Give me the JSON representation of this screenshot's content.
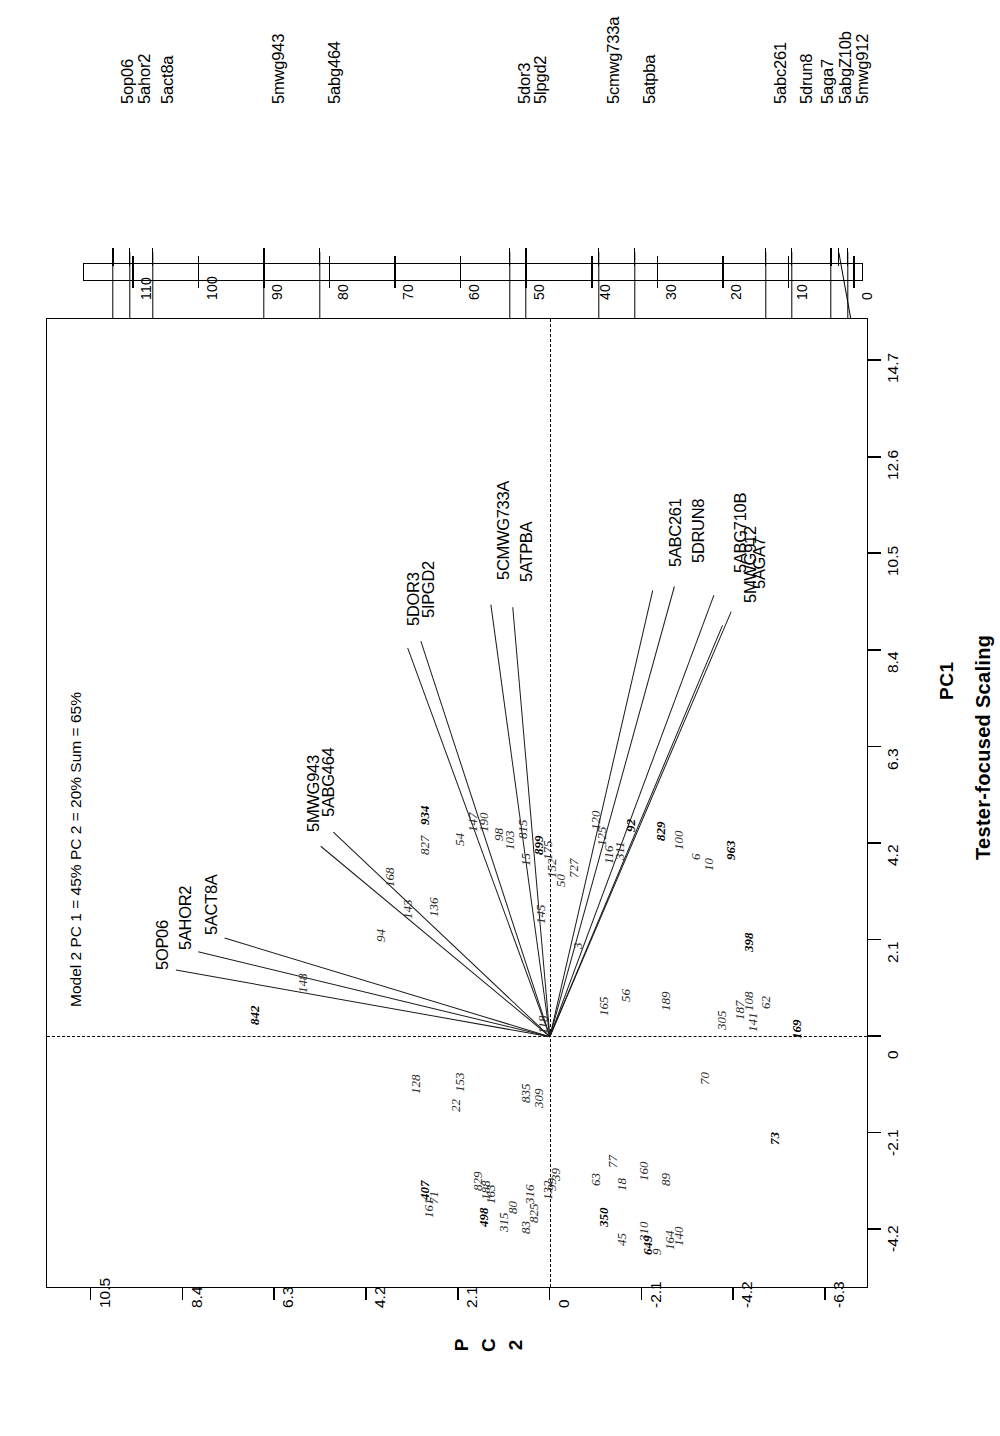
{
  "figure": {
    "title": "Tester-focused Scaling",
    "model_caption": "Model 2 PC 1 = 45% PC 2 = 20% Sum = 65%"
  },
  "axes": {
    "pc1": {
      "title": "PC1",
      "ticks": [
        "-4.2",
        "-2.1",
        "0",
        "2.1",
        "4.2",
        "6.3",
        "8.4",
        "10.5",
        "12.6",
        "14.7"
      ]
    },
    "pc2": {
      "title_chars": [
        "P",
        "C",
        "2"
      ],
      "ticks": [
        "10.5",
        "8.4",
        "6.3",
        "4.2",
        "2.1",
        "0",
        "-2.1",
        "-4.2",
        "-6.3"
      ]
    }
  },
  "linkage_map": {
    "scale_ticks": [
      "110",
      "100",
      "90",
      "80",
      "70",
      "60",
      "50",
      "40",
      "30",
      "20",
      "10",
      "0"
    ],
    "markers": [
      {
        "label": "5op06",
        "cm": 113.0
      },
      {
        "label": "5ahor2",
        "cm": 110.5
      },
      {
        "label": "5act8a",
        "cm": 107.0
      },
      {
        "label": "5mwg943",
        "cm": 90.0
      },
      {
        "label": "5abg464",
        "cm": 81.5
      },
      {
        "label": "5dor3",
        "cm": 52.5
      },
      {
        "label": "5lpgd2",
        "cm": 50.0
      },
      {
        "label": "5cmwg733a",
        "cm": 39.0
      },
      {
        "label": "5atpba",
        "cm": 33.5
      },
      {
        "label": "5abc261",
        "cm": 13.5
      },
      {
        "label": "5drun8",
        "cm": 9.5
      },
      {
        "label": "5abgZ10b",
        "cm": 3.5
      },
      {
        "label": "5aga7",
        "cm": 2.3
      },
      {
        "label": "5mwg912",
        "cm": 1.0
      }
    ]
  },
  "chart_data": {
    "type": "scatter",
    "title": "Tester-focused Scaling",
    "subtitle": "Model 2 PC 1 = 45% PC 2 = 20% Sum = 65%",
    "xlabel": "PC1",
    "ylabel": "PC 2",
    "xlim": [
      -5.5,
      15.6
    ],
    "ylim": [
      -7.3,
      11.5
    ],
    "grid": false,
    "legend": "none",
    "note": "GGE biplot rotated 90 degrees; marker vectors radiate from origin (0,0); italic numbers are genotype entry codes.",
    "vectors": [
      {
        "name": "5OP06",
        "pc1": 1.45,
        "pc2": 8.55
      },
      {
        "name": "5AHOR2",
        "pc1": 1.85,
        "pc2": 8.05
      },
      {
        "name": "5ACT8A",
        "pc1": 2.15,
        "pc2": 7.45
      },
      {
        "name": "5MWG943",
        "pc1": 4.15,
        "pc2": 5.25
      },
      {
        "name": "5ABG464",
        "pc1": 4.45,
        "pc2": 4.95
      },
      {
        "name": "5DOR3",
        "pc1": 8.45,
        "pc2": 3.25
      },
      {
        "name": "5IPGD2",
        "pc1": 8.6,
        "pc2": 2.95
      },
      {
        "name": "5CMWG733A",
        "pc1": 9.4,
        "pc2": 1.35
      },
      {
        "name": "5ATPBA",
        "pc1": 9.35,
        "pc2": 0.85
      },
      {
        "name": "5ABC261",
        "pc1": 9.7,
        "pc2": -2.35
      },
      {
        "name": "5DRUN8",
        "pc1": 9.8,
        "pc2": -2.85
      },
      {
        "name": "5MWG912",
        "pc1": 8.95,
        "pc2": -3.95
      },
      {
        "name": "5AGA7",
        "pc1": 9.25,
        "pc2": -4.15
      },
      {
        "name": "5ABG710B",
        "pc1": 9.6,
        "pc2": -3.75
      }
    ],
    "genotypes": [
      {
        "id": "842",
        "pc1": 0.35,
        "pc2": 7.05,
        "bold": true
      },
      {
        "id": "148",
        "pc1": 1.05,
        "pc2": 5.95
      },
      {
        "id": "94",
        "pc1": 2.15,
        "pc2": 4.15
      },
      {
        "id": "143",
        "pc1": 2.65,
        "pc2": 3.55
      },
      {
        "id": "136",
        "pc1": 2.7,
        "pc2": 2.95
      },
      {
        "id": "168",
        "pc1": 3.35,
        "pc2": 3.95
      },
      {
        "id": "827",
        "pc1": 4.05,
        "pc2": 3.15
      },
      {
        "id": "54",
        "pc1": 4.25,
        "pc2": 2.35
      },
      {
        "id": "934",
        "pc1": 4.7,
        "pc2": 3.15,
        "bold": true
      },
      {
        "id": "147",
        "pc1": 4.55,
        "pc2": 2.05
      },
      {
        "id": "190",
        "pc1": 4.55,
        "pc2": 1.8
      },
      {
        "id": "98",
        "pc1": 4.35,
        "pc2": 1.45
      },
      {
        "id": "103",
        "pc1": 4.15,
        "pc2": 1.2
      },
      {
        "id": "815",
        "pc1": 4.4,
        "pc2": 0.9
      },
      {
        "id": "899",
        "pc1": 4.05,
        "pc2": 0.55,
        "bold": true
      },
      {
        "id": "15",
        "pc1": 3.8,
        "pc2": 0.85
      },
      {
        "id": "175",
        "pc1": 3.95,
        "pc2": 0.35
      },
      {
        "id": "152",
        "pc1": 3.55,
        "pc2": 0.25
      },
      {
        "id": "50",
        "pc1": 3.35,
        "pc2": 0.05
      },
      {
        "id": "727",
        "pc1": 3.55,
        "pc2": -0.25
      },
      {
        "id": "145",
        "pc1": 2.55,
        "pc2": 0.5
      },
      {
        "id": "3",
        "pc1": 2.0,
        "pc2": -0.35
      },
      {
        "id": "118",
        "pc1": 0.15,
        "pc2": 0.45
      },
      {
        "id": "165",
        "pc1": 0.55,
        "pc2": -0.95
      },
      {
        "id": "56",
        "pc1": 0.85,
        "pc2": -1.45
      },
      {
        "id": "189",
        "pc1": 0.65,
        "pc2": -2.35
      },
      {
        "id": "92",
        "pc1": 4.55,
        "pc2": -1.55,
        "bold": true
      },
      {
        "id": "120",
        "pc1": 4.6,
        "pc2": -0.75
      },
      {
        "id": "125",
        "pc1": 4.25,
        "pc2": -0.9
      },
      {
        "id": "116",
        "pc1": 3.85,
        "pc2": -1.05
      },
      {
        "id": "311",
        "pc1": 3.95,
        "pc2": -1.3
      },
      {
        "id": "829",
        "pc1": 4.35,
        "pc2": -2.25,
        "bold": true
      },
      {
        "id": "100",
        "pc1": 4.15,
        "pc2": -2.65
      },
      {
        "id": "6",
        "pc1": 3.95,
        "pc2": -3.05
      },
      {
        "id": "10",
        "pc1": 3.7,
        "pc2": -3.35
      },
      {
        "id": "963",
        "pc1": 3.95,
        "pc2": -3.85,
        "bold": true
      },
      {
        "id": "398",
        "pc1": 1.95,
        "pc2": -4.25,
        "bold": true
      },
      {
        "id": "305",
        "pc1": 0.25,
        "pc2": -3.65
      },
      {
        "id": "187",
        "pc1": 0.45,
        "pc2": -4.05
      },
      {
        "id": "108",
        "pc1": 0.65,
        "pc2": -4.25
      },
      {
        "id": "62",
        "pc1": 0.7,
        "pc2": -4.65
      },
      {
        "id": "141",
        "pc1": 0.2,
        "pc2": -4.35
      },
      {
        "id": "169",
        "pc1": 0.05,
        "pc2": -5.35,
        "bold": true
      },
      {
        "id": "70",
        "pc1": -0.95,
        "pc2": -3.25
      },
      {
        "id": "73",
        "pc1": -2.25,
        "pc2": -4.85,
        "bold": true
      },
      {
        "id": "22",
        "pc1": -1.55,
        "pc2": 2.45
      },
      {
        "id": "128",
        "pc1": -1.15,
        "pc2": 3.35
      },
      {
        "id": "153",
        "pc1": -1.1,
        "pc2": 2.35
      },
      {
        "id": "835",
        "pc1": -1.35,
        "pc2": 0.85
      },
      {
        "id": "309",
        "pc1": -1.45,
        "pc2": 0.55
      },
      {
        "id": "407",
        "pc1": -3.45,
        "pc2": 3.15,
        "bold": true
      },
      {
        "id": "161",
        "pc1": -3.85,
        "pc2": 3.05
      },
      {
        "id": "71",
        "pc1": -3.55,
        "pc2": 2.95
      },
      {
        "id": "829b",
        "pc1": -3.25,
        "pc2": 1.95
      },
      {
        "id": "188",
        "pc1": -3.45,
        "pc2": 1.75
      },
      {
        "id": "163",
        "pc1": -3.55,
        "pc2": 1.65
      },
      {
        "id": "498",
        "pc1": -4.05,
        "pc2": 1.8,
        "bold": true
      },
      {
        "id": "315",
        "pc1": -4.15,
        "pc2": 1.35
      },
      {
        "id": "80",
        "pc1": -3.75,
        "pc2": 1.15
      },
      {
        "id": "83",
        "pc1": -4.2,
        "pc2": 0.85
      },
      {
        "id": "825",
        "pc1": -3.95,
        "pc2": 0.65
      },
      {
        "id": "316",
        "pc1": -3.55,
        "pc2": 0.75
      },
      {
        "id": "132",
        "pc1": -3.45,
        "pc2": 0.35
      },
      {
        "id": "39",
        "pc1": -3.05,
        "pc2": 0.15
      },
      {
        "id": "99",
        "pc1": -3.25,
        "pc2": 0.25
      },
      {
        "id": "63",
        "pc1": -3.15,
        "pc2": -0.75
      },
      {
        "id": "77",
        "pc1": -2.75,
        "pc2": -1.15
      },
      {
        "id": "18",
        "pc1": -3.25,
        "pc2": -1.35
      },
      {
        "id": "160",
        "pc1": -3.05,
        "pc2": -1.85
      },
      {
        "id": "89",
        "pc1": -3.15,
        "pc2": -2.35
      },
      {
        "id": "350",
        "pc1": -4.05,
        "pc2": -0.95,
        "bold": true
      },
      {
        "id": "45",
        "pc1": -4.45,
        "pc2": -1.35
      },
      {
        "id": "310",
        "pc1": -4.35,
        "pc2": -1.85
      },
      {
        "id": "9",
        "pc1": -4.65,
        "pc2": -2.15
      },
      {
        "id": "164",
        "pc1": -4.55,
        "pc2": -2.45
      },
      {
        "id": "140",
        "pc1": -4.45,
        "pc2": -2.65
      },
      {
        "id": "649",
        "pc1": -4.65,
        "pc2": -1.95,
        "bold": true
      }
    ]
  }
}
